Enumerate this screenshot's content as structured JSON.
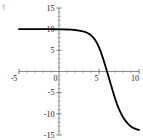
{
  "corner": {
    "mark": "⸮"
  },
  "chart_data": {
    "type": "line",
    "title": "",
    "subtitle": "",
    "xlabel": "",
    "ylabel": "",
    "xlim": [
      -5,
      10
    ],
    "ylim": [
      -15,
      15
    ],
    "grid": false,
    "legend": null,
    "legend_position": "none",
    "axes_style": "centered-cross",
    "line_color": "#000000",
    "line_width": 1.8,
    "x_ticks": [
      -5,
      0,
      5,
      10
    ],
    "x_tick_labels": [
      "-5",
      "0",
      "5",
      "10"
    ],
    "y_ticks": [
      -15,
      -10,
      -5,
      5,
      10,
      15
    ],
    "y_tick_labels": [
      "-15",
      "-10",
      "-5",
      "5",
      "10",
      "15"
    ],
    "minor_ticks": true,
    "series": [
      {
        "name": "curve",
        "x": [
          -5.0,
          -4.5,
          -4.0,
          -3.5,
          -3.0,
          -2.5,
          -2.0,
          -1.5,
          -1.0,
          -0.5,
          0.0,
          0.5,
          1.0,
          1.5,
          2.0,
          2.5,
          3.0,
          3.25,
          3.5,
          3.75,
          4.0,
          4.25,
          4.5,
          4.75,
          5.0,
          5.25,
          5.5,
          5.75,
          6.0,
          6.25,
          6.5,
          6.75,
          7.0,
          7.25,
          7.5,
          7.75,
          8.0,
          8.25,
          8.5,
          8.75,
          9.0,
          9.25,
          9.5,
          9.75,
          10.0
        ],
        "y": [
          10.0,
          10.0,
          10.0,
          10.0,
          10.0,
          10.0,
          10.0,
          9.99,
          9.99,
          9.98,
          9.97,
          9.95,
          9.92,
          9.88,
          9.8,
          9.68,
          9.5,
          9.35,
          9.15,
          8.9,
          8.55,
          8.1,
          7.5,
          6.7,
          5.7,
          4.5,
          3.1,
          1.6,
          0.0,
          -1.6,
          -3.2,
          -4.8,
          -6.3,
          -7.7,
          -8.9,
          -9.9,
          -10.8,
          -11.5,
          -12.1,
          -12.6,
          -13.0,
          -13.3,
          -13.5,
          -13.7,
          -13.8
        ]
      }
    ]
  }
}
